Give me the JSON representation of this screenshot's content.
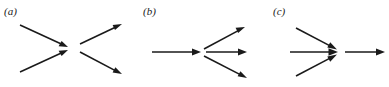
{
  "figure": {
    "background_color": "#ffffff",
    "stroke_color": "#1a1a1a",
    "width": 389,
    "height": 87,
    "caption_style": "italic-serif-parenthesized"
  },
  "panels": [
    {
      "id": "a",
      "label": "(a)",
      "description": "two arrows converge from the left and two arrows diverge to the right, crossing in an X pattern",
      "incoming_count": 2,
      "outgoing_count": 2,
      "vertex": {
        "x": 73,
        "y": 46
      },
      "arrows": [
        {
          "name": "arrow-in-upper-left",
          "direction": "down-right",
          "from": [
            20,
            25
          ],
          "to": [
            68,
            47
          ],
          "head_at": "end"
        },
        {
          "name": "arrow-in-lower-left",
          "direction": "up-right",
          "from": [
            20,
            72
          ],
          "to": [
            68,
            50
          ],
          "head_at": "end"
        },
        {
          "name": "arrow-out-upper-right",
          "direction": "up-right",
          "from": [
            80,
            44
          ],
          "to": [
            122,
            24
          ],
          "head_at": "end"
        },
        {
          "name": "arrow-out-lower-right",
          "direction": "down-right",
          "from": [
            80,
            52
          ],
          "to": [
            122,
            74
          ],
          "head_at": "end"
        }
      ]
    },
    {
      "id": "b",
      "label": "(b)",
      "description": "one horizontal arrow enters from the left and three arrows fan out to the right",
      "incoming_count": 1,
      "outgoing_count": 3,
      "vertex": {
        "x": 73,
        "y": 52
      },
      "arrows": [
        {
          "name": "arrow-in-left",
          "direction": "right",
          "from": [
            22,
            52
          ],
          "to": [
            70,
            52
          ],
          "head_at": "end"
        },
        {
          "name": "arrow-out-upper-right",
          "direction": "up-right",
          "from": [
            74,
            49
          ],
          "to": [
            115,
            27
          ],
          "head_at": "end"
        },
        {
          "name": "arrow-out-right",
          "direction": "right",
          "from": [
            76,
            52
          ],
          "to": [
            117,
            52
          ],
          "head_at": "end"
        },
        {
          "name": "arrow-out-lower-right",
          "direction": "down-right",
          "from": [
            74,
            56
          ],
          "to": [
            117,
            78
          ],
          "head_at": "end"
        }
      ]
    },
    {
      "id": "c",
      "label": "(c)",
      "description": "three arrows converge from the left into a node and one horizontal arrow exits to the right",
      "incoming_count": 3,
      "outgoing_count": 1,
      "vertex": {
        "x": 77,
        "y": 52
      },
      "arrows": [
        {
          "name": "arrow-in-upper-left",
          "direction": "down-right",
          "from": [
            36,
            28
          ],
          "to": [
            76,
            49
          ],
          "head_at": "end"
        },
        {
          "name": "arrow-in-left",
          "direction": "right",
          "from": [
            30,
            52
          ],
          "to": [
            77,
            52
          ],
          "head_at": "end"
        },
        {
          "name": "arrow-in-lower-left",
          "direction": "up-right",
          "from": [
            36,
            76
          ],
          "to": [
            76,
            55
          ],
          "head_at": "end"
        },
        {
          "name": "arrow-out-right",
          "direction": "right",
          "from": [
            85,
            52
          ],
          "to": [
            125,
            52
          ],
          "head_at": "end"
        }
      ]
    }
  ]
}
